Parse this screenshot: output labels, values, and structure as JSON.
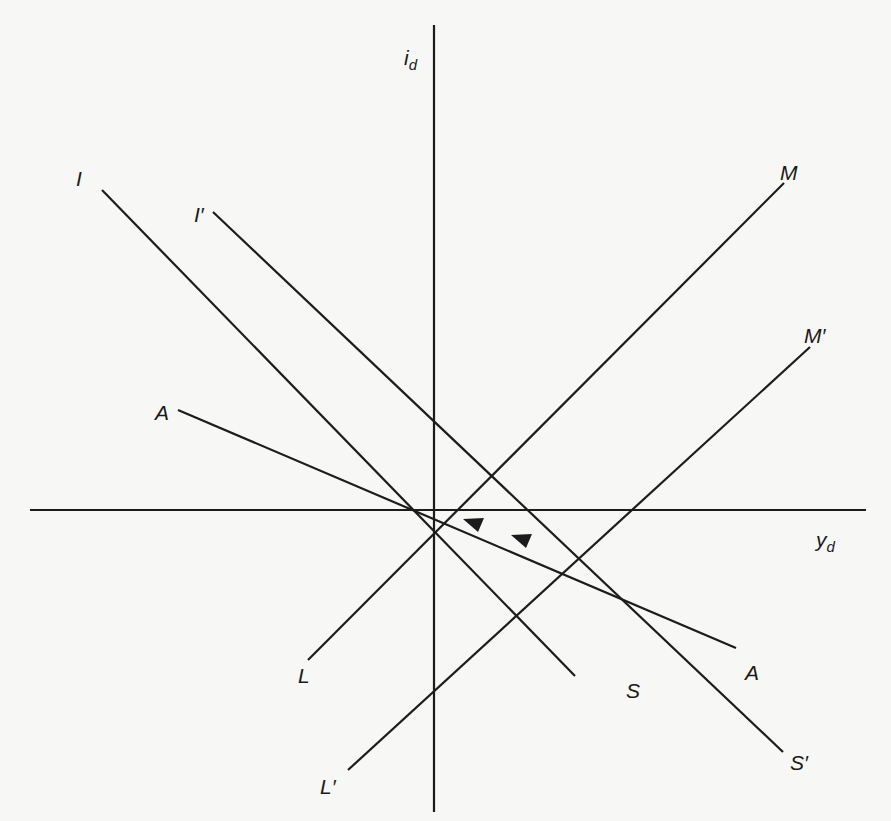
{
  "diagram": {
    "axes": {
      "vertical": {
        "label": "i",
        "subscript": "d"
      },
      "horizontal": {
        "label": "y",
        "subscript": "d"
      }
    },
    "lines": [
      {
        "name": "I-S",
        "start_label": "I",
        "end_label": "S"
      },
      {
        "name": "I'-S'",
        "start_label": "I′",
        "end_label": "S′"
      },
      {
        "name": "M-L",
        "start_label": "M",
        "end_label": "L"
      },
      {
        "name": "M'-L'",
        "start_label": "M′",
        "end_label": "L′"
      },
      {
        "name": "A-A",
        "start_label": "A",
        "end_label": "A",
        "arrows": 2,
        "arrow_direction": "toward origin"
      }
    ],
    "labels": {
      "I": "I",
      "I_prime": "I′",
      "M": "M",
      "M_prime": "M′",
      "A_left": "A",
      "A_right": "A",
      "L": "L",
      "L_prime": "L′",
      "S": "S",
      "S_prime": "S′",
      "id_main": "i",
      "id_sub": "d",
      "yd_main": "y",
      "yd_sub": "d"
    }
  }
}
